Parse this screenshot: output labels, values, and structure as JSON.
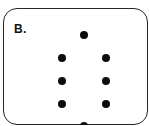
{
  "figure": {
    "label": "B.",
    "colors": {
      "background": "#ffffff",
      "border": "#262626",
      "dot": "#0d0d0d",
      "label_text": "#111111"
    },
    "dot_diameter_px": 8,
    "dot_count": 8,
    "dots": [
      {
        "x": 79.5,
        "y": 25.5
      },
      {
        "x": 58,
        "y": 48.5
      },
      {
        "x": 101.5,
        "y": 48.5
      },
      {
        "x": 58,
        "y": 72
      },
      {
        "x": 101.5,
        "y": 72
      },
      {
        "x": 58,
        "y": 94.5
      },
      {
        "x": 101.5,
        "y": 94.5
      },
      {
        "x": 79.5,
        "y": 116.5
      }
    ]
  }
}
